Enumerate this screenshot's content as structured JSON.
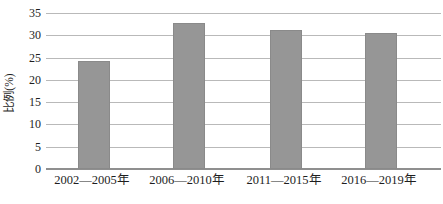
{
  "chart_data": {
    "type": "bar",
    "title": "",
    "categories": [
      "2002—2005年",
      "2006—2010年",
      "2011—2015年",
      "2016—2019年"
    ],
    "values": [
      24.3,
      32.8,
      31.2,
      30.5
    ],
    "xlabel": "",
    "ylabel": "比例(%)",
    "ylim": [
      0,
      35
    ],
    "yticks": [
      0,
      5,
      10,
      15,
      20,
      25,
      30,
      35
    ],
    "grid": true,
    "legend": "none",
    "bar_color": "#969696",
    "bar_border_color": "#8a8a8a",
    "gridline_color": "#b9b9b9",
    "axis_line_color": "#8f8f8f",
    "text_color": "#1e1e1e"
  }
}
